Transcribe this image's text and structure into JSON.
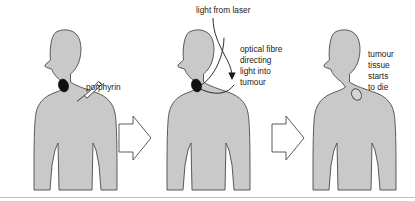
{
  "figure": {
    "background_color": "#ffffff",
    "body_fill_color": "#c9c9c9",
    "body_outline_color": "#4a4a4a",
    "tumour_color": "#111111",
    "dying_tumour_color": "#d6d6d6",
    "text_color": "#1a1a1a"
  },
  "panels": [
    {
      "id": "panel-1",
      "figure_name": "person-silhouette-1",
      "labels": [
        {
          "text": "porphyrin",
          "lines": [
            "porphyrin"
          ]
        }
      ],
      "annotations": [
        "syringe-injecting-porphyrin",
        "tumour-dark-spot"
      ]
    },
    {
      "id": "panel-2",
      "figure_name": "person-silhouette-2",
      "labels": [
        {
          "text": "light from laser",
          "lines": [
            "light from laser"
          ]
        },
        {
          "text": "optical fibre directing light into tumour",
          "lines": [
            "optical fibre",
            "directing",
            "light into",
            "tumour"
          ]
        }
      ],
      "annotations": [
        "laser-arrow",
        "optical-fibre-line",
        "tumour-dark-spot"
      ]
    },
    {
      "id": "panel-3",
      "figure_name": "person-silhouette-3",
      "labels": [
        {
          "text": "tumour tissue starts to die",
          "lines": [
            "tumour",
            "tissue",
            "starts",
            "to die"
          ]
        }
      ],
      "annotations": [
        "tumour-dying-spot"
      ]
    }
  ],
  "text": {
    "porphyrin": "porphyrin",
    "light_from_laser": "light from laser",
    "optical_fibre_l1": "optical fibre",
    "optical_fibre_l2": "directing",
    "optical_fibre_l3": "light into",
    "optical_fibre_l4": "tumour",
    "tumour_dies_l1": "tumour",
    "tumour_dies_l2": "tissue",
    "tumour_dies_l3": "starts",
    "tumour_dies_l4": "to die"
  },
  "arrows": [
    {
      "name": "process-arrow-1",
      "direction": "right"
    },
    {
      "name": "process-arrow-2",
      "direction": "right"
    }
  ]
}
